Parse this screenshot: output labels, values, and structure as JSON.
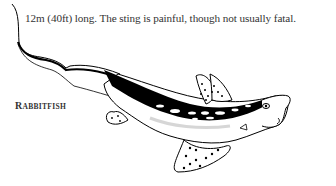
{
  "page": {
    "body_text": "12m (40ft) long. The sting is painful, though not usually fatal.",
    "caption": {
      "first_letter": "R",
      "rest": "abbitfish"
    }
  },
  "illustration": {
    "subject": "rabbitfish-drawing",
    "ink_color": "#000000",
    "paper_color": "#ffffff"
  }
}
